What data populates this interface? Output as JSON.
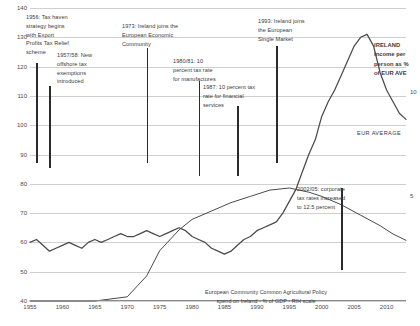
{
  "chart_data": {
    "type": "line",
    "title": "",
    "xlabel": "",
    "ylabel": "",
    "ylim": [
      40,
      140
    ],
    "xlim": [
      1955,
      2013
    ],
    "grid": true,
    "legend": "annotations-inline",
    "y_ticks": [
      "40",
      "50",
      "60",
      "70",
      "80",
      "90",
      "100",
      "110",
      "120",
      "130",
      "140"
    ],
    "x_ticks": [
      "1955",
      "1960",
      "1965",
      "1970",
      "1975",
      "1980",
      "1985",
      "1990",
      "1995",
      "2000",
      "2005",
      "2010"
    ],
    "right_axis": {
      "label": "",
      "ticks": [
        "5",
        "10"
      ],
      "ylim": [
        0,
        14
      ]
    },
    "series": [
      {
        "name": "IRELAND income per person as % of EUR AVE",
        "axis": "left",
        "color": "#4a4a4a",
        "x": [
          1955,
          1956,
          1957,
          1958,
          1959,
          1960,
          1961,
          1962,
          1963,
          1964,
          1965,
          1966,
          1967,
          1968,
          1969,
          1970,
          1971,
          1972,
          1973,
          1974,
          1975,
          1976,
          1977,
          1978,
          1979,
          1980,
          1981,
          1982,
          1983,
          1984,
          1985,
          1986,
          1987,
          1988,
          1989,
          1990,
          1991,
          1992,
          1993,
          1994,
          1995,
          1996,
          1997,
          1998,
          1999,
          2000,
          2001,
          2002,
          2003,
          2004,
          2005,
          2006,
          2007,
          2008,
          2009,
          2010,
          2011,
          2012,
          2013
        ],
        "y": [
          60,
          61,
          59,
          57,
          58,
          59,
          60,
          59,
          58,
          60,
          61,
          60,
          61,
          62,
          63,
          62,
          62,
          63,
          64,
          63,
          62,
          63,
          64,
          65,
          64,
          62,
          61,
          60,
          58,
          57,
          56,
          57,
          59,
          61,
          62,
          64,
          65,
          66,
          67,
          70,
          74,
          78,
          84,
          90,
          95,
          103,
          108,
          112,
          117,
          122,
          127,
          130,
          131,
          127,
          118,
          112,
          108,
          104,
          102
        ]
      },
      {
        "name": "European Community Common Agricultural Policy spend on Ireland - % of GDP - RiH scale",
        "axis": "right",
        "color": "#4a4a4a",
        "x": [
          1955,
          1960,
          1965,
          1970,
          1973,
          1975,
          1978,
          1980,
          1983,
          1986,
          1989,
          1992,
          1995,
          1998,
          2000,
          2003,
          2006,
          2009,
          2011,
          2013
        ],
        "y": [
          0,
          0,
          0,
          0.2,
          1.2,
          2.4,
          3.4,
          3.9,
          4.3,
          4.7,
          5.0,
          5.3,
          5.4,
          5.2,
          5.0,
          4.6,
          4.1,
          3.6,
          3.2,
          2.9
        ]
      }
    ],
    "annotations": [
      {
        "id": "a1",
        "year": 1956,
        "text": "1956: Tax haven\nstrategy begins\nwith Export\nProfits Tax Relief\nscheme"
      },
      {
        "id": "a2",
        "year": 1958,
        "text": "1957/58: New\noffshore tax\nexemptions\nintroduced"
      },
      {
        "id": "a3",
        "year": 1973,
        "text": "1973: Ireland joins the\nEuropean Economic\nCommunity"
      },
      {
        "id": "a4",
        "year": 1981,
        "text": "1980/81: 10\npercent tax rate\nfor manufactures"
      },
      {
        "id": "a5",
        "year": 1987,
        "text": "1987: 10 percent tax\nrate for financial\nservices"
      },
      {
        "id": "a6",
        "year": 1993,
        "text": "1993: Ireland joins\nthe European\nSingle Market"
      },
      {
        "id": "a7",
        "year": 2003,
        "text": "2002/05: corporate\ntax rates increased\nto 12.5 percent"
      }
    ],
    "series_labels": {
      "ireland": "IRELAND\nincome per\nperson as %\nof EUR AVE",
      "eur_average": "EUR AVERAGE",
      "cap": "European Community Common Agricultural Policy\nspend on Ireland - % of GDP - RIH scale"
    }
  }
}
